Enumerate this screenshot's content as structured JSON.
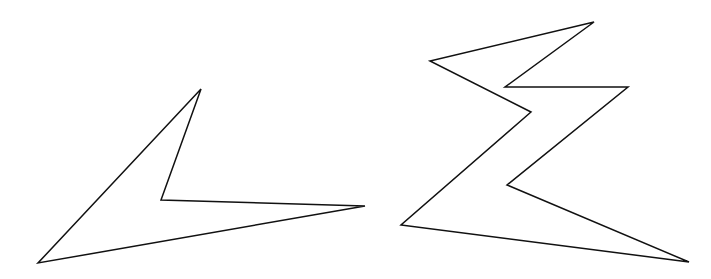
{
  "diagram": {
    "shapes": [
      {
        "name": "left-polygon",
        "type": "concave-polygon",
        "vertex_count": 4,
        "stroke": "#111111",
        "fill": "none"
      },
      {
        "name": "right-polygon",
        "type": "concave-polygon",
        "vertex_count": 8,
        "stroke": "#111111",
        "fill": "none"
      }
    ]
  }
}
